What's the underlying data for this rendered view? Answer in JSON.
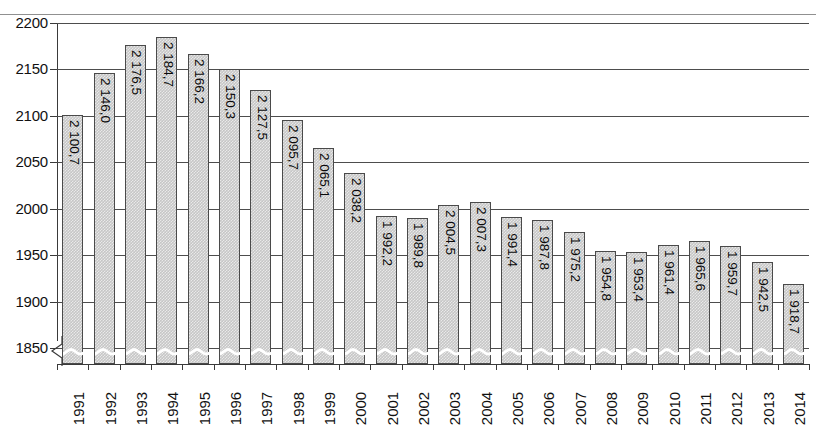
{
  "chart_data": {
    "type": "bar",
    "title": "",
    "xlabel": "",
    "ylabel": "",
    "ylim": [
      1850,
      2200
    ],
    "y_ticks": [
      1850,
      1900,
      1950,
      2000,
      2050,
      2100,
      2150,
      2200
    ],
    "y_tick_labels": [
      "1850",
      "1900",
      "1950",
      "2000",
      "2050",
      "2100",
      "2150",
      "2200"
    ],
    "axis_break": true,
    "grid": true,
    "legend": "none",
    "bar_color": "#c6c6c6",
    "bar_edge_color": "#4a4a4a",
    "categories": [
      "1991",
      "1992",
      "1993",
      "1994",
      "1995",
      "1996",
      "1997",
      "1998",
      "1999",
      "2000",
      "2001",
      "2002",
      "2003",
      "2004",
      "2005",
      "2006",
      "2007",
      "2008",
      "2009",
      "2010",
      "2011",
      "2012",
      "2013",
      "2014"
    ],
    "values": [
      2100.7,
      2146.0,
      2176.5,
      2184.7,
      2166.2,
      2150.3,
      2127.5,
      2095.7,
      2065.1,
      2038.2,
      1992.2,
      1989.8,
      2004.5,
      2007.3,
      1991.4,
      1987.8,
      1975.2,
      1954.8,
      1953.4,
      1961.4,
      1965.6,
      1959.7,
      1942.5,
      1918.7
    ],
    "value_labels": [
      "2 100,7",
      "2 146,0",
      "2 176,5",
      "2 184,7",
      "2 166,2",
      "2 150,3",
      "2 127,5",
      "2 095,7",
      "2 065,1",
      "2 038,2",
      "1 992,2",
      "1 989,8",
      "2 004,5",
      "2 007,3",
      "1 991,4",
      "1 987,8",
      "1 975,2",
      "1 954,8",
      "1 953,4",
      "1 961,4",
      "1 965,6",
      "1 959,7",
      "1 942,5",
      "1 918,7"
    ]
  }
}
